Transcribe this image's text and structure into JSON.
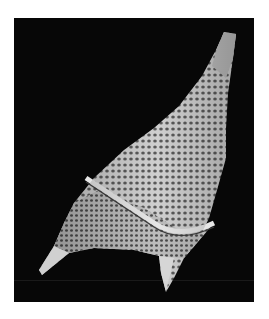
{
  "image": {
    "subject": "SEM micrograph of a dinoflagellate cyst",
    "background_color": "#070707",
    "specimen_color": "#d8d8d8",
    "frame_color": "#ffffff"
  }
}
